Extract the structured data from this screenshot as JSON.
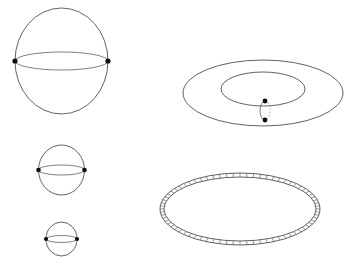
{
  "figure": {
    "background_color": "#ffffff",
    "line_color": "#3a3a3a",
    "node_color": "#0d0d0d",
    "dashed_line_color": "#8d8d8d",
    "width": 356,
    "height": 266,
    "faint_headers": [
      {
        "text": "",
        "x": 112,
        "y": 1
      },
      {
        "text": "",
        "x": 238,
        "y": 0
      }
    ],
    "panels": [
      {
        "id": "sphere-large",
        "name": "Sphere with two marked points (large)",
        "shape": "sphere",
        "center_x": 61.5,
        "center_y": 61,
        "radius_x": 46.5,
        "radius_y": 53,
        "equator_half_height": 9,
        "marked_points": [
          {
            "x": 15,
            "y": 61
          },
          {
            "x": 108,
            "y": 61
          }
        ],
        "marked_point_count": 2,
        "node_radius": 2.6
      },
      {
        "id": "sphere-medium",
        "name": "Sphere with two marked points (medium)",
        "shape": "sphere",
        "center_x": 61.5,
        "center_y": 170,
        "radius_x": 23,
        "radius_y": 25,
        "equator_half_height": 5,
        "marked_points": [
          {
            "x": 38.5,
            "y": 170
          },
          {
            "x": 84.5,
            "y": 170
          }
        ],
        "marked_point_count": 2,
        "node_radius": 2.3
      },
      {
        "id": "sphere-small",
        "name": "Sphere with two marked points (small)",
        "shape": "sphere",
        "center_x": 61.5,
        "center_y": 239,
        "radius_x": 15.5,
        "radius_y": 17,
        "equator_half_height": 3.5,
        "marked_points": [
          {
            "x": 46,
            "y": 239
          },
          {
            "x": 77,
            "y": 239
          }
        ],
        "marked_point_count": 2,
        "node_radius": 2.1
      },
      {
        "id": "torus",
        "name": "Torus with marked meridian circle",
        "shape": "torus",
        "center_x": 263,
        "center_y": 93,
        "outer_radius_x": 80,
        "outer_radius_y": 33,
        "inner_radius_x": 42,
        "inner_radius_y": 17,
        "meridian": {
          "center_x": 265,
          "center_y": 110.5,
          "radius_x": 5,
          "radius_y": 9.5,
          "front_arc": "solid",
          "back_arc": "dashed"
        },
        "marked_points": [
          {
            "x": 265,
            "y": 101
          },
          {
            "x": 265,
            "y": 120
          }
        ],
        "marked_point_count": 2,
        "node_radius": 2.4
      },
      {
        "id": "annulus-band",
        "name": "Annulus band with radial rungs",
        "shape": "annulus",
        "center_x": 240,
        "center_y": 209,
        "outer_radius_x": 80,
        "outer_radius_y": 36,
        "inner_radius_x": 76,
        "inner_radius_y": 32,
        "rung_count": 72,
        "marked_points": [],
        "marked_point_count": 0
      }
    ]
  }
}
